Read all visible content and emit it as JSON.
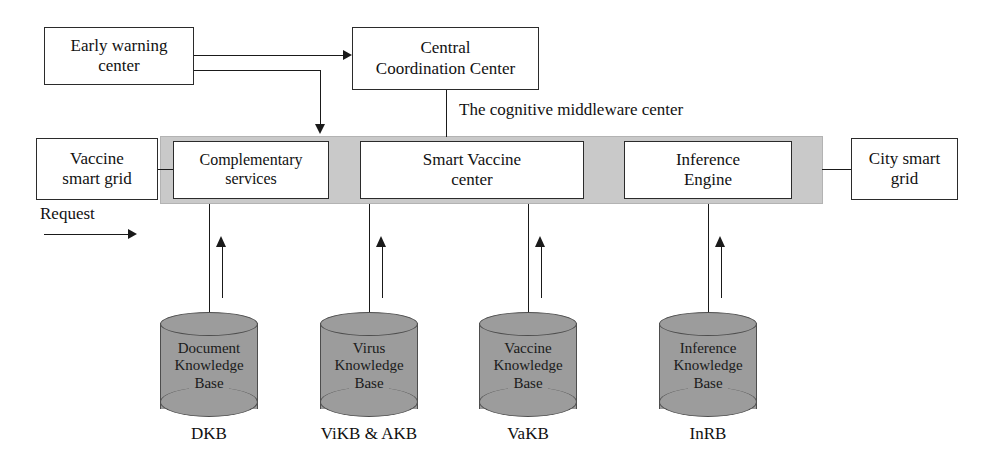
{
  "diagram": {
    "colors": {
      "bar_gray": "#c9c9c9",
      "cylinder_gray": "#9c9c9c",
      "line": "#1a1a1a",
      "box_border": "#2b2b2b",
      "background": "#ffffff"
    }
  },
  "top_boxes": [
    {
      "id": "early-warning-center",
      "label": "Early warning\ncenter"
    },
    {
      "id": "central-coordination-center",
      "label": "Central\nCoordination Center"
    }
  ],
  "external_grids": [
    {
      "id": "vaccine-smart-grid",
      "label": "Vaccine\nsmart grid"
    },
    {
      "id": "city-smart-grid",
      "label": "City smart\ngrid"
    }
  ],
  "middleware": {
    "caption": "The cognitive middleware center",
    "components": [
      {
        "id": "complementary-services",
        "label": "Complementary\nservices"
      },
      {
        "id": "smart-vaccine-center",
        "label": "Smart Vaccine\ncenter"
      },
      {
        "id": "inference-engine",
        "label": "Inference\nEngine"
      }
    ]
  },
  "labels": {
    "request": "Request"
  },
  "knowledge_bases": [
    {
      "id": "dkb",
      "label": "Document\nKnowledge\nBase",
      "caption": "DKB"
    },
    {
      "id": "vikb",
      "label": "Virus\nKnowledge\nBase",
      "caption": "ViKB & AKB"
    },
    {
      "id": "vakb",
      "label": "Vaccine\nKnowledge\nBase",
      "caption": "VaKB"
    },
    {
      "id": "inrb",
      "label": "Inference\nKnowledge\nBase",
      "caption": "InRB"
    }
  ]
}
